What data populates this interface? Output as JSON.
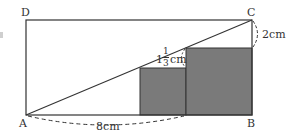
{
  "diagram": {
    "colors": {
      "line": "#333333",
      "shade": "#7a7a7a",
      "background": "#ffffff"
    },
    "rectangle": {
      "name": "ABCD",
      "vertices": {
        "A": {
          "label": "A",
          "x": 26,
          "y": 115
        },
        "B": {
          "label": "B",
          "x": 252,
          "y": 115
        },
        "C": {
          "label": "C",
          "x": 252,
          "y": 20
        },
        "D": {
          "label": "D",
          "x": 26,
          "y": 20
        }
      }
    },
    "diagonal": {
      "from": "A",
      "to": "C"
    },
    "squares": [
      {
        "name": "small-square",
        "x": 140,
        "y": 68,
        "width": 46,
        "height": 47,
        "shaded": true
      },
      {
        "name": "large-square",
        "x": 186,
        "y": 48,
        "width": 66,
        "height": 67,
        "shaded": true
      }
    ],
    "measurements": {
      "ab_segment": {
        "text": "8cm",
        "description": "from A to the right edge of the small square"
      },
      "c_gap": {
        "text": "2cm",
        "description": "from C down to top of large square"
      },
      "step_gap": {
        "whole": "1",
        "numerator": "1",
        "denominator": "3",
        "unit": "cm",
        "description": "height difference between the two squares"
      }
    }
  }
}
